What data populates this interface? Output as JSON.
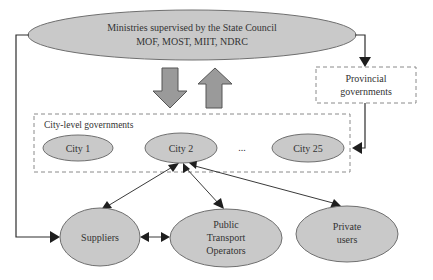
{
  "ministries": {
    "line1": "Ministries supervised by the State Council",
    "line2": "MOF, MOST, MIIT, NDRC"
  },
  "provincial": {
    "line1": "Provincial",
    "line2": "governments"
  },
  "city_level": {
    "title": "City-level governments",
    "cities": [
      "City 1",
      "City 2",
      "City 25"
    ],
    "ellipsis": "..."
  },
  "actors": {
    "suppliers": "Suppliers",
    "public_transport": [
      "Public",
      "Transport",
      "Operators"
    ],
    "private_users": [
      "Private",
      "users"
    ]
  },
  "colors": {
    "node_fill": "#c9c9c9",
    "big_arrow_fill": "#9a9a9a",
    "line": "#2e2e2e"
  }
}
